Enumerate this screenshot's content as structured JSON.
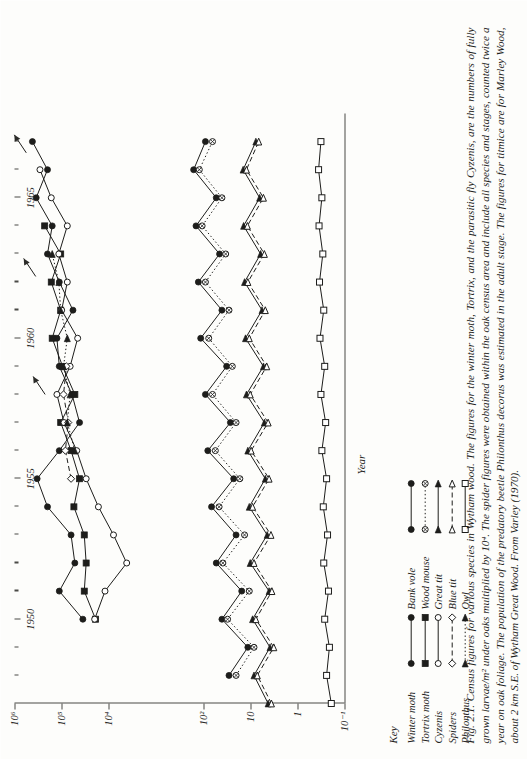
{
  "figure": {
    "number": "Fig. 2.1.",
    "caption": "Fig. 2.1. Census figures for various species in Wytham wood. The figures for the winter moth, Tortrix, and the parasitic fly Cyzenis, are the numbers of fully grown larvae/m² under oaks multiplied by 10⁴. The spider figures were obtained within the oak census area and include all species and stages, counted twice a year on oak foliage. The population of the predatory beetle Philonthus decorus was estimated in the adult stage. The figures for titmice are for Marley Wood, about 2 km S.E. of Wytham Great Wood. From Varley (1970)."
  },
  "keys": {
    "title": "Key",
    "column1": [
      {
        "label": "Winter moth",
        "marker": "filled-circle",
        "line": "solid"
      },
      {
        "label": "Tortrix moth",
        "marker": "filled-square",
        "line": "solid"
      },
      {
        "label": "Cyzenis",
        "marker": "open-circle",
        "line": "solid"
      },
      {
        "label": "Spiders",
        "marker": "open-diamond",
        "line": "dashed"
      },
      {
        "label": "Philonthus",
        "marker": "filled-triangle",
        "line": "dotted"
      }
    ],
    "column2": [
      {
        "label": "Bank vole",
        "marker": "filled-circle",
        "line": "solid"
      },
      {
        "label": "Wood mouse",
        "marker": "crossed-circle",
        "line": "dotted"
      },
      {
        "label": "Great tit",
        "marker": "filled-triangle",
        "line": "solid"
      },
      {
        "label": "Blue tit",
        "marker": "open-triangle",
        "line": "dashed"
      },
      {
        "label": "Owl",
        "marker": "open-square",
        "line": "solid"
      }
    ]
  },
  "chart_data": {
    "type": "line",
    "title": "",
    "xlabel": "Year",
    "ylabel": "Numbers per hectare",
    "xlim": [
      1947,
      1968
    ],
    "ylim": [
      -1,
      6
    ],
    "yscale": "log10",
    "grid": false,
    "legend_position": "below-left",
    "xticks": [
      1950,
      1955,
      1960,
      1965
    ],
    "xticks_minor": [
      1948,
      1949,
      1951,
      1952,
      1953,
      1954,
      1956,
      1957,
      1958,
      1959,
      1961,
      1962,
      1963,
      1964,
      1966,
      1967
    ],
    "yticks": [
      "10⁶",
      "10⁵",
      "10⁴",
      "10²",
      "10",
      "1",
      "10⁻¹"
    ],
    "ytick_exponents": [
      6,
      5,
      4,
      2,
      1,
      0,
      -1
    ],
    "series": [
      {
        "name": "Winter moth",
        "marker": "filled-circle",
        "line": "solid",
        "x": [
          1950,
          1951,
          1952,
          1953,
          1954,
          1955,
          1956,
          1957,
          1958,
          1959,
          1960,
          1961,
          1962,
          1963,
          1964,
          1965,
          1966,
          1967
        ],
        "y": [
          4.55,
          5.05,
          4.72,
          4.8,
          5.3,
          5.52,
          5.05,
          4.62,
          4.78,
          5.05,
          5.1,
          4.76,
          5.05,
          5.3,
          5.2,
          5.54,
          5.3,
          5.62
        ]
      },
      {
        "name": "Tortrix moth",
        "marker": "filled-square",
        "line": "solid",
        "x": [
          1950,
          1951,
          1952,
          1953,
          1954,
          1955,
          1956,
          1957,
          1958,
          1959,
          1960,
          1961,
          1962,
          1963,
          1964
        ],
        "y": [
          4.28,
          4.52,
          4.48,
          4.52,
          4.74,
          4.62,
          4.8,
          5.02,
          4.72,
          4.98,
          5.2,
          5.02,
          5.22,
          5.02,
          5.36
        ]
      },
      {
        "name": "Cyzenis",
        "marker": "open-circle",
        "line": "solid",
        "x": [
          1950,
          1951,
          1952,
          1953,
          1954,
          1955,
          1956,
          1957,
          1958,
          1959,
          1960,
          1961,
          1962,
          1963,
          1964,
          1965,
          1966
        ],
        "y": [
          4.3,
          4.08,
          3.62,
          3.9,
          4.22,
          4.48,
          4.68,
          4.95,
          5.1,
          4.82,
          4.66,
          5.0,
          4.88,
          5.06,
          4.88,
          5.22,
          5.46
        ]
      },
      {
        "name": "Spiders",
        "marker": "open-diamond",
        "line": "dashed",
        "x": [
          1955,
          1956,
          1957,
          1958,
          1959
        ],
        "y": [
          4.8,
          4.92,
          4.86,
          4.96,
          4.9
        ]
      },
      {
        "name": "Philonthus",
        "marker": "filled-triangle",
        "line": "dotted",
        "x": [
          1956,
          1957,
          1958,
          1959,
          1960,
          1961,
          1962,
          1963
        ],
        "y": [
          4.72,
          4.88,
          4.82,
          4.96,
          4.88,
          5.02,
          5.06,
          5.2
        ]
      },
      {
        "name": "Bank vole",
        "marker": "filled-circle",
        "line": "solid",
        "x": [
          1948,
          1949,
          1950,
          1951,
          1952,
          1953,
          1954,
          1955,
          1956,
          1957,
          1958,
          1959,
          1960,
          1961,
          1962,
          1963,
          1964,
          1965,
          1966,
          1967
        ],
        "y": [
          1.45,
          1.05,
          1.6,
          1.18,
          1.72,
          1.3,
          1.82,
          1.35,
          1.9,
          1.42,
          1.95,
          1.5,
          2.05,
          1.6,
          2.1,
          1.65,
          2.15,
          1.72,
          2.2,
          1.95
        ]
      },
      {
        "name": "Wood mouse",
        "marker": "crossed-circle",
        "line": "dotted",
        "x": [
          1948,
          1949,
          1950,
          1951,
          1952,
          1953,
          1954,
          1955,
          1956,
          1957,
          1958,
          1959,
          1960,
          1961,
          1962,
          1963,
          1964,
          1965,
          1966,
          1967
        ],
        "y": [
          1.3,
          0.92,
          1.48,
          1.02,
          1.58,
          1.12,
          1.66,
          1.22,
          1.74,
          1.3,
          1.8,
          1.38,
          1.88,
          1.45,
          1.95,
          1.52,
          2.02,
          1.6,
          2.08,
          1.8
        ]
      },
      {
        "name": "Great tit",
        "marker": "filled-triangle",
        "line": "solid",
        "x": [
          1947,
          1948,
          1949,
          1950,
          1951,
          1952,
          1953,
          1954,
          1955,
          1956,
          1957,
          1958,
          1959,
          1960,
          1961,
          1962,
          1963,
          1964,
          1965,
          1966,
          1967
        ],
        "y": [
          0.62,
          0.92,
          0.58,
          0.95,
          0.6,
          1.0,
          0.64,
          1.02,
          0.68,
          1.05,
          0.7,
          1.08,
          0.72,
          1.1,
          0.75,
          1.12,
          0.78,
          1.14,
          0.8,
          1.15,
          0.88
        ]
      },
      {
        "name": "Blue tit",
        "marker": "open-triangle",
        "line": "dashed",
        "x": [
          1947,
          1948,
          1949,
          1950,
          1951,
          1952,
          1953,
          1954,
          1955,
          1956,
          1957,
          1958,
          1959,
          1960,
          1961,
          1962,
          1963,
          1964,
          1965,
          1966,
          1967
        ],
        "y": [
          0.55,
          0.85,
          0.5,
          0.88,
          0.54,
          0.92,
          0.56,
          0.95,
          0.6,
          0.98,
          0.62,
          1.0,
          0.65,
          1.02,
          0.68,
          1.05,
          0.7,
          1.06,
          0.72,
          1.08,
          0.82
        ]
      },
      {
        "name": "Owl",
        "marker": "open-square",
        "line": "solid",
        "x": [
          1947,
          1948,
          1949,
          1950,
          1951,
          1952,
          1953,
          1954,
          1955,
          1956,
          1957,
          1958,
          1959,
          1960,
          1961,
          1962,
          1963,
          1964,
          1965,
          1966,
          1967
        ],
        "y": [
          -0.72,
          -0.62,
          -0.68,
          -0.58,
          -0.66,
          -0.56,
          -0.64,
          -0.55,
          -0.62,
          -0.52,
          -0.6,
          -0.5,
          -0.58,
          -0.48,
          -0.56,
          -0.47,
          -0.54,
          -0.46,
          -0.52,
          -0.45,
          -0.5
        ]
      }
    ],
    "annotations": [
      {
        "text": "",
        "type": "arrow",
        "x": 1966.6,
        "y": 5.75
      },
      {
        "text": "",
        "type": "arrow",
        "x": 1962.2,
        "y": 5.55
      },
      {
        "text": "",
        "type": "arrow",
        "x": 1958.0,
        "y": 5.35
      }
    ]
  }
}
